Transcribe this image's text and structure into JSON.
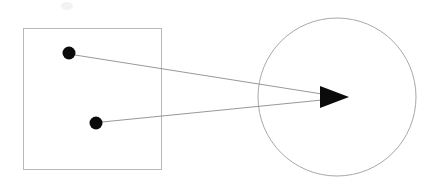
{
  "figure": {
    "title": "",
    "background_color": "#ffffff",
    "width": 433,
    "height": 188,
    "stroke_light": "#b0b0b0",
    "stroke_mid": "#8c8c8c",
    "fill_dark": "#0b0b0b",
    "smudge_color": "#f0f0f0"
  },
  "shapes": {
    "square": {
      "label": "source-region-square",
      "x": 23,
      "y": 28,
      "width": 138,
      "height": 141,
      "stroke": "#b8b8b8",
      "stroke_width": 1,
      "fill": "none"
    },
    "circle": {
      "label": "target-region-circle",
      "cx": 337,
      "cy": 97,
      "r": 79,
      "stroke": "#a8a8a8",
      "stroke_width": 1,
      "fill": "none"
    },
    "dots": [
      {
        "label": "upper-point",
        "cx": 69,
        "cy": 53,
        "r": 6.5,
        "fill": "#0b0b0b"
      },
      {
        "label": "lower-point",
        "cx": 96,
        "cy": 123,
        "r": 6.5,
        "fill": "#0b0b0b"
      }
    ],
    "connectors": [
      {
        "label": "upper-connector-line",
        "x1": 75,
        "y1": 55,
        "x2": 322,
        "y2": 94,
        "stroke": "#8c8c8c",
        "stroke_width": 0.9
      },
      {
        "label": "lower-connector-line",
        "x1": 102,
        "y1": 122,
        "x2": 322,
        "y2": 100,
        "stroke": "#8c8c8c",
        "stroke_width": 0.9
      }
    ],
    "arrowhead": {
      "label": "arrowhead",
      "points": "320,86 320,108 349,97",
      "fill": "#0b0b0b",
      "tip_x": 349,
      "tip_y": 97
    },
    "smudge": {
      "label": "faint-artifact",
      "cx": 67,
      "cy": 6,
      "rx": 6,
      "ry": 4,
      "fill": "#f2f2f2"
    }
  }
}
